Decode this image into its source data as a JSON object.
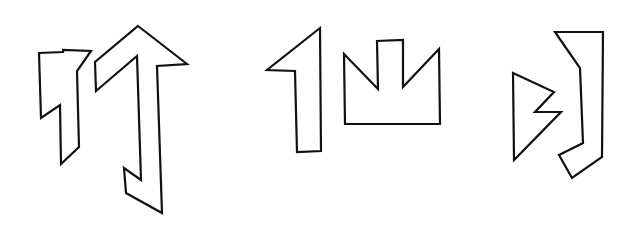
{
  "canvas": {
    "width": 637,
    "height": 234,
    "background": "#ffffff",
    "stroke": "#111111"
  },
  "figures": [
    {
      "id": "shape-1",
      "description": "polygon with notched top and diagonal lower-left cut",
      "points": "39,53 63,52 63,50 91,51 77,71 79,147 61,164 60,105 41,118"
    },
    {
      "id": "shape-2",
      "description": "tall arrow pointing up with hooked bottom",
      "points": "138,26 187,64 157,66 162,213 126,193 124,168 141,180 137,56 96,91 95,62"
    },
    {
      "id": "shape-3",
      "description": "numeral-one-like shape",
      "points": "320,28 267,70 295,71 297,152 321,151"
    },
    {
      "id": "shape-4",
      "description": "crown-like shape with center notch",
      "points": "344,54 378,89 377,41 403,40 403,87 439,49 440,124 345,124"
    },
    {
      "id": "shape-5",
      "description": "triangle with zigzag notch on right",
      "points": "513,73 554,92 535,112 561,112 514,160"
    },
    {
      "id": "shape-6",
      "description": "bracket-like shape with hooked bottom",
      "points": "555,32 603,32 602,157 572,178 559,155 583,143 580,68"
    }
  ]
}
